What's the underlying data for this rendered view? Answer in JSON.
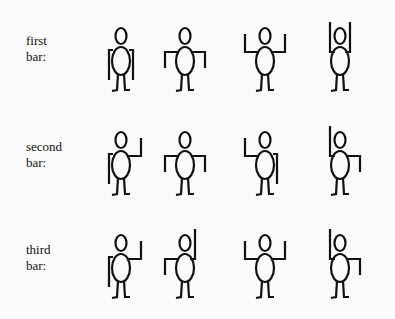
{
  "rows": [
    {
      "label_line1": "first",
      "label_line2": "bar:",
      "figures": [
        {
          "left": "down",
          "right": "down"
        },
        {
          "left": "out",
          "right": "out"
        },
        {
          "left": "up",
          "right": "up"
        },
        {
          "left": "high",
          "right": "high"
        }
      ]
    },
    {
      "label_line1": "second",
      "label_line2": "bar:",
      "figures": [
        {
          "left": "down",
          "right": "up"
        },
        {
          "left": "out",
          "right": "out"
        },
        {
          "left": "up",
          "right": "down"
        },
        {
          "left": "high",
          "right": "out"
        }
      ]
    },
    {
      "label_line1": "third",
      "label_line2": "bar:",
      "figures": [
        {
          "left": "down",
          "right": "up"
        },
        {
          "left": "out",
          "right": "high"
        },
        {
          "left": "up",
          "right": "up"
        },
        {
          "left": "high",
          "right": "out"
        }
      ]
    }
  ]
}
